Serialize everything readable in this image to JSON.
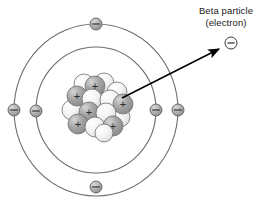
{
  "diagram": {
    "title_label": {
      "line1": "Beta particle",
      "line2": "(electron)"
    },
    "colors": {
      "stroke": "#5a5a5a",
      "arrow": "#000000",
      "text": "#1a1a1a",
      "proton_fill": "#9e9e9e",
      "neutron_fill": "#f2f2f2",
      "electron_fill": "#b3b3b3",
      "background": "#ffffff"
    },
    "center": {
      "x": 96,
      "y": 110
    },
    "shells": [
      {
        "name": "outer-shell",
        "rx": 82,
        "ry": 86
      },
      {
        "name": "inner-shell",
        "rx": 60,
        "ry": 63
      }
    ],
    "electrons": [
      {
        "name": "electron-outer-top",
        "shell": "outer",
        "x": 96,
        "y": 24,
        "symbol": "−"
      },
      {
        "name": "electron-outer-bottom",
        "shell": "outer",
        "x": 96,
        "y": 187,
        "symbol": "−"
      },
      {
        "name": "electron-outer-left",
        "shell": "outer",
        "x": 14,
        "y": 110,
        "symbol": "−"
      },
      {
        "name": "electron-outer-right",
        "shell": "outer",
        "x": 178,
        "y": 110,
        "symbol": "−"
      },
      {
        "name": "electron-inner-left",
        "shell": "inner",
        "x": 36,
        "y": 111,
        "symbol": "−"
      },
      {
        "name": "electron-inner-right",
        "shell": "inner",
        "x": 156,
        "y": 110,
        "symbol": "−"
      }
    ],
    "beta_particle": {
      "name": "beta-particle-electron",
      "x": 231,
      "y": 43,
      "r": 6,
      "symbol": "−"
    },
    "emission_arrow": {
      "name": "beta-emission-arrow",
      "from": {
        "x": 122,
        "y": 98
      },
      "to": {
        "x": 221,
        "y": 48
      }
    },
    "nucleus": {
      "name": "atomic-nucleus",
      "proton_symbol": "+",
      "neutron_symbol": "",
      "particles": [
        {
          "type": "neutron",
          "x": 84,
          "y": 84,
          "r": 10
        },
        {
          "type": "neutron",
          "x": 104,
          "y": 83,
          "r": 10
        },
        {
          "type": "proton",
          "x": 95,
          "y": 86,
          "r": 10
        },
        {
          "type": "neutron",
          "x": 117,
          "y": 92,
          "r": 10
        },
        {
          "type": "proton",
          "x": 77,
          "y": 96,
          "r": 10
        },
        {
          "type": "neutron",
          "x": 92,
          "y": 99,
          "r": 10
        },
        {
          "type": "neutron",
          "x": 110,
          "y": 100,
          "r": 10
        },
        {
          "type": "proton",
          "x": 123,
          "y": 104,
          "r": 10
        },
        {
          "type": "neutron",
          "x": 72,
          "y": 110,
          "r": 10
        },
        {
          "type": "proton",
          "x": 89,
          "y": 112,
          "r": 10
        },
        {
          "type": "neutron",
          "x": 106,
          "y": 113,
          "r": 10
        },
        {
          "type": "neutron",
          "x": 120,
          "y": 117,
          "r": 10
        },
        {
          "type": "proton",
          "x": 78,
          "y": 124,
          "r": 10
        },
        {
          "type": "neutron",
          "x": 95,
          "y": 127,
          "r": 10
        },
        {
          "type": "proton",
          "x": 113,
          "y": 126,
          "r": 10
        },
        {
          "type": "neutron",
          "x": 104,
          "y": 133,
          "r": 9
        }
      ]
    }
  }
}
